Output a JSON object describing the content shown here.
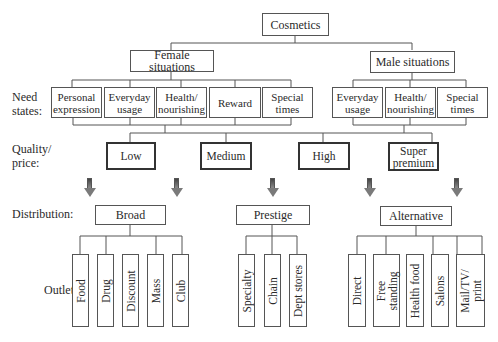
{
  "root": {
    "label": "Cosmetics"
  },
  "segments": {
    "female": {
      "label": "Female situations"
    },
    "male": {
      "label": "Male situations"
    }
  },
  "row_labels": {
    "need_states": "Need\nstates:",
    "quality_price": "Quality/\nprice:",
    "distribution": "Distribution:",
    "outlets": "Outlets:"
  },
  "need_states": {
    "female": [
      {
        "label": "Personal\nexpression"
      },
      {
        "label": "Everyday\nusage"
      },
      {
        "label": "Health/\nnourishing"
      },
      {
        "label": "Reward"
      },
      {
        "label": "Special\ntimes"
      }
    ],
    "male": [
      {
        "label": "Everyday\nusage"
      },
      {
        "label": "Health/\nnourishing"
      },
      {
        "label": "Special\ntimes"
      }
    ]
  },
  "quality_price": [
    {
      "label": "Low"
    },
    {
      "label": "Medium"
    },
    {
      "label": "High"
    },
    {
      "label": "Super\npremium"
    }
  ],
  "distribution": [
    {
      "label": "Broad",
      "outlets": [
        "Food",
        "Drug",
        "Discount",
        "Mass",
        "Club"
      ]
    },
    {
      "label": "Prestige",
      "outlets": [
        "Specialty",
        "Chain",
        "Dept stores"
      ]
    },
    {
      "label": "Alternative",
      "outlets": [
        "Direct",
        "Free\nstanding",
        "Health food",
        "Salons",
        "Mail/TV/\nprint"
      ]
    }
  ]
}
